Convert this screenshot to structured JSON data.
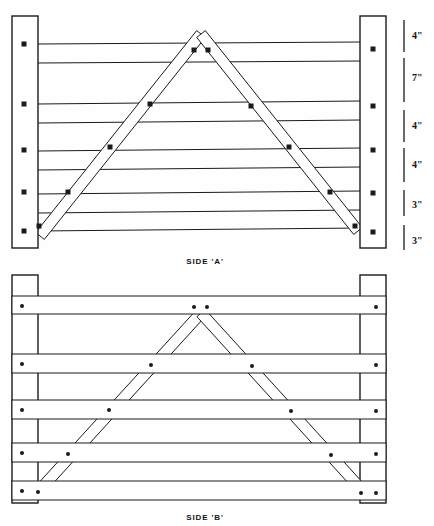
{
  "sheet": {
    "width": 434,
    "height": 526,
    "background": "#fefefe",
    "ink": "#1a1a1a",
    "fill": "#ffffff"
  },
  "views": [
    {
      "id": "side-a",
      "caption": "SIDE 'A'",
      "caption_x": 205,
      "caption_y": 257,
      "frame": {
        "x": 12,
        "y": 16,
        "w": 374,
        "h": 232
      },
      "posts": [
        {
          "name": "left-post",
          "x": 12,
          "y": 16,
          "w": 26,
          "h": 232
        },
        {
          "name": "right-post",
          "x": 360,
          "y": 16,
          "w": 26,
          "h": 232
        }
      ],
      "rails": [
        {
          "name": "rail-1",
          "y_left": 44,
          "y_right": 42
        },
        {
          "name": "rail-2",
          "y_left": 63,
          "y_right": 61
        },
        {
          "name": "rail-3",
          "y_left": 104,
          "y_right": 101
        },
        {
          "name": "rail-4",
          "y_left": 123,
          "y_right": 120
        },
        {
          "name": "rail-5",
          "y_left": 151,
          "y_right": 148
        },
        {
          "name": "rail-6",
          "y_left": 170,
          "y_right": 167
        },
        {
          "name": "rail-7",
          "y_left": 194,
          "y_right": 191
        },
        {
          "name": "rail-8",
          "y_left": 213,
          "y_right": 210
        },
        {
          "name": "rail-9",
          "y_left": 231,
          "y_right": 228
        }
      ],
      "brace": {
        "name": "a-frame-brace",
        "apex_x": 201,
        "apex_y": 34,
        "left_foot_x": 40,
        "left_foot_y": 236,
        "right_foot_x": 358,
        "right_foot_y": 231,
        "thickness": 11
      },
      "bolts": [
        {
          "x": 24,
          "y": 44
        },
        {
          "x": 24,
          "y": 104
        },
        {
          "x": 24,
          "y": 150
        },
        {
          "x": 24,
          "y": 192
        },
        {
          "x": 24,
          "y": 231
        },
        {
          "x": 373,
          "y": 49
        },
        {
          "x": 373,
          "y": 106
        },
        {
          "x": 373,
          "y": 150
        },
        {
          "x": 373,
          "y": 193
        },
        {
          "x": 373,
          "y": 232
        },
        {
          "x": 194,
          "y": 50
        },
        {
          "x": 208,
          "y": 50
        },
        {
          "x": 150,
          "y": 104
        },
        {
          "x": 251,
          "y": 106
        },
        {
          "x": 110,
          "y": 147
        },
        {
          "x": 289,
          "y": 147
        },
        {
          "x": 68,
          "y": 192
        },
        {
          "x": 330,
          "y": 192
        },
        {
          "x": 39,
          "y": 226
        },
        {
          "x": 355,
          "y": 226
        }
      ],
      "bolt_shape": "square",
      "bolt_size": 5,
      "dimensions": [
        {
          "label": "4\"",
          "tick_x": 404,
          "tick_top": 20,
          "tick_bottom": 52,
          "label_x": 412,
          "label_y": 30
        },
        {
          "label": "7\"",
          "tick_x": 404,
          "tick_top": 58,
          "tick_bottom": 102,
          "label_x": 412,
          "label_y": 72
        },
        {
          "label": "4\"",
          "tick_x": 404,
          "tick_top": 110,
          "tick_bottom": 142,
          "label_x": 412,
          "label_y": 120
        },
        {
          "label": "4\"",
          "tick_x": 404,
          "tick_top": 148,
          "tick_bottom": 182,
          "label_x": 412,
          "label_y": 159
        },
        {
          "label": "3\"",
          "tick_x": 404,
          "tick_top": 190,
          "tick_bottom": 216,
          "label_x": 412,
          "label_y": 199
        },
        {
          "label": "3\"",
          "tick_x": 404,
          "tick_top": 225,
          "tick_bottom": 250,
          "label_x": 412,
          "label_y": 235
        }
      ]
    },
    {
      "id": "side-b",
      "caption": "SIDE 'B'",
      "caption_x": 205,
      "caption_y": 513,
      "frame": {
        "x": 12,
        "y": 275,
        "w": 374,
        "h": 228
      },
      "posts": [
        {
          "name": "left-post",
          "x": 12,
          "y": 275,
          "w": 26,
          "h": 228
        },
        {
          "name": "right-post",
          "x": 360,
          "y": 275,
          "w": 26,
          "h": 228
        }
      ],
      "rails": [
        {
          "name": "rail-1",
          "y_top": 296,
          "y_bottom": 313
        },
        {
          "name": "rail-2",
          "y_top": 313,
          "y_bottom": 316
        },
        {
          "name": "rail-3",
          "y_top": 354,
          "y_bottom": 372
        },
        {
          "name": "rail-4",
          "y_top": 372,
          "y_bottom": 375
        },
        {
          "name": "rail-5",
          "y_top": 400,
          "y_bottom": 418
        },
        {
          "name": "rail-6",
          "y_top": 418,
          "y_bottom": 421
        },
        {
          "name": "rail-7",
          "y_top": 443,
          "y_bottom": 461
        },
        {
          "name": "rail-8",
          "y_top": 461,
          "y_bottom": 464
        },
        {
          "name": "rail-9",
          "y_top": 481,
          "y_bottom": 499
        }
      ],
      "rail_bands": [
        {
          "name": "rail-band-1",
          "y": 296,
          "h": 18
        },
        {
          "name": "rail-band-2",
          "y": 354,
          "h": 19
        },
        {
          "name": "rail-band-3",
          "y": 400,
          "h": 19
        },
        {
          "name": "rail-band-4",
          "y": 443,
          "h": 19
        },
        {
          "name": "rail-band-5",
          "y": 481,
          "h": 19
        }
      ],
      "brace": {
        "name": "a-frame-brace-hidden",
        "apex_x": 201,
        "apex_y": 313,
        "left_foot_x": 36,
        "left_foot_y": 494,
        "right_foot_x": 362,
        "right_foot_y": 490,
        "thickness": 11
      },
      "bolts": [
        {
          "x": 22,
          "y": 306
        },
        {
          "x": 22,
          "y": 364
        },
        {
          "x": 22,
          "y": 410
        },
        {
          "x": 22,
          "y": 453
        },
        {
          "x": 22,
          "y": 491
        },
        {
          "x": 376,
          "y": 307
        },
        {
          "x": 376,
          "y": 365
        },
        {
          "x": 376,
          "y": 411
        },
        {
          "x": 376,
          "y": 454
        },
        {
          "x": 376,
          "y": 493
        },
        {
          "x": 194,
          "y": 307
        },
        {
          "x": 207,
          "y": 307
        },
        {
          "x": 151,
          "y": 365
        },
        {
          "x": 252,
          "y": 366
        },
        {
          "x": 109,
          "y": 410
        },
        {
          "x": 291,
          "y": 411
        },
        {
          "x": 68,
          "y": 454
        },
        {
          "x": 331,
          "y": 455
        },
        {
          "x": 38,
          "y": 492
        },
        {
          "x": 361,
          "y": 493
        }
      ],
      "bolt_shape": "round",
      "bolt_size": 4
    }
  ]
}
